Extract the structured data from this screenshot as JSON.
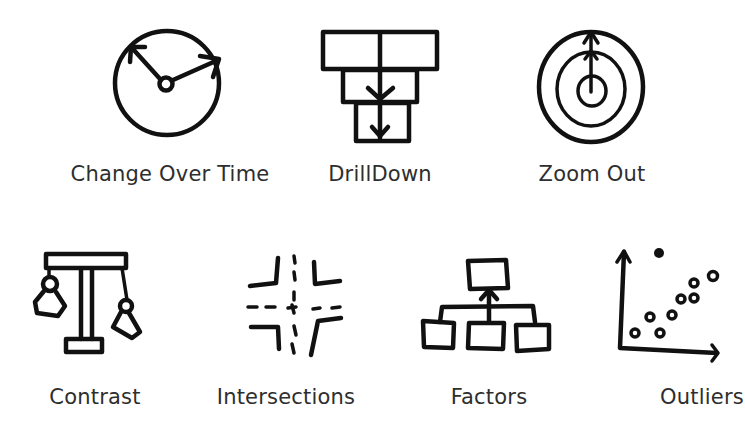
{
  "background": "#ffffff",
  "ink_color": "#111111",
  "label_color": "#2e2e2e",
  "rows": [
    {
      "items": [
        {
          "id": "change-over-time",
          "label": "Change Over Time",
          "icon": "clock-icon"
        },
        {
          "id": "drilldown",
          "label": "DrillDown",
          "icon": "stacked-boxes-arrow-icon"
        },
        {
          "id": "zoom-out",
          "label": "Zoom Out",
          "icon": "concentric-circles-arrow-icon"
        }
      ]
    },
    {
      "items": [
        {
          "id": "contrast",
          "label": "Contrast",
          "icon": "balance-scale-icon"
        },
        {
          "id": "intersections",
          "label": "Intersections",
          "icon": "crossroads-icon"
        },
        {
          "id": "factors",
          "label": "Factors",
          "icon": "hierarchy-tree-icon"
        },
        {
          "id": "outliers",
          "label": "Outliers",
          "icon": "scatter-plot-outlier-icon"
        }
      ]
    }
  ]
}
